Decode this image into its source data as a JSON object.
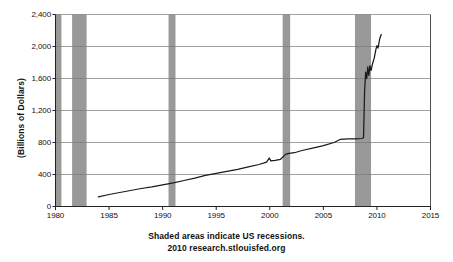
{
  "chart_data": {
    "type": "line",
    "title": "",
    "subtitle": "",
    "xlabel": "",
    "ylabel": "(Billions of Dollars)",
    "xlim": [
      1980,
      2015
    ],
    "ylim": [
      0,
      2400
    ],
    "grid": true,
    "legend_position": "none",
    "xticks": [
      "1980",
      "1985",
      "1990",
      "1995",
      "2000",
      "2005",
      "2010",
      "2015"
    ],
    "xtick_values": [
      1980,
      1985,
      1990,
      1995,
      2000,
      2005,
      2010,
      2015
    ],
    "yticks": [
      "0",
      "400",
      "800",
      "1,200",
      "1,600",
      "2,000",
      "2,400"
    ],
    "ytick_values": [
      0,
      400,
      800,
      1200,
      1600,
      2000,
      2400
    ],
    "line_color": "#1a1a1a",
    "shade_color": "#999999",
    "series": [
      {
        "name": "Monetary Base",
        "points": [
          [
            1984.0,
            120
          ],
          [
            1985.0,
            150
          ],
          [
            1986.0,
            175
          ],
          [
            1987.0,
            200
          ],
          [
            1988.0,
            225
          ],
          [
            1989.0,
            245
          ],
          [
            1990.0,
            270
          ],
          [
            1991.0,
            295
          ],
          [
            1992.0,
            325
          ],
          [
            1993.0,
            355
          ],
          [
            1994.0,
            390
          ],
          [
            1995.0,
            415
          ],
          [
            1996.0,
            440
          ],
          [
            1997.0,
            465
          ],
          [
            1998.0,
            495
          ],
          [
            1999.0,
            525
          ],
          [
            1999.7,
            555
          ],
          [
            1999.95,
            605
          ],
          [
            2000.1,
            570
          ],
          [
            2000.5,
            578
          ],
          [
            2001.0,
            590
          ],
          [
            2001.5,
            655
          ],
          [
            2001.8,
            665
          ],
          [
            2002.3,
            672
          ],
          [
            2003.0,
            700
          ],
          [
            2004.0,
            730
          ],
          [
            2005.0,
            760
          ],
          [
            2006.0,
            800
          ],
          [
            2006.6,
            840
          ],
          [
            2007.3,
            845
          ],
          [
            2008.0,
            845
          ],
          [
            2008.6,
            850
          ],
          [
            2008.75,
            860
          ],
          [
            2008.85,
            1450
          ],
          [
            2008.95,
            1680
          ],
          [
            2009.05,
            1600
          ],
          [
            2009.15,
            1745
          ],
          [
            2009.25,
            1640
          ],
          [
            2009.35,
            1760
          ],
          [
            2009.45,
            1700
          ],
          [
            2009.6,
            1790
          ],
          [
            2009.75,
            1855
          ],
          [
            2009.9,
            1960
          ],
          [
            2010.0,
            2010
          ],
          [
            2010.1,
            1980
          ],
          [
            2010.25,
            2090
          ],
          [
            2010.4,
            2150
          ]
        ]
      }
    ],
    "recession_bands": [
      {
        "label": "1980 recession",
        "start": 1980.0,
        "end": 1980.55
      },
      {
        "label": "1981-1982 recession",
        "start": 1981.55,
        "end": 1982.9
      },
      {
        "label": "1990-1991 recession",
        "start": 1990.55,
        "end": 1991.2
      },
      {
        "label": "2001 recession",
        "start": 2001.2,
        "end": 2001.9
      },
      {
        "label": "2007-2009 recession",
        "start": 2007.95,
        "end": 2009.45
      }
    ],
    "annotations": [
      "Shaded areas indicate US recessions.",
      "2010 research.stlouisfed.org"
    ]
  },
  "footer": {
    "line1": "Shaded areas indicate US recessions.",
    "line2": "2010 research.stlouisfed.org"
  },
  "axis": {
    "y_title": "(Billions of Dollars)"
  }
}
